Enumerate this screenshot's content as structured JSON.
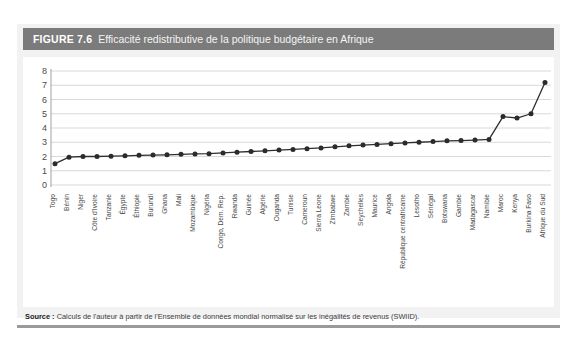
{
  "figure": {
    "number": "FIGURE 7.6",
    "title": "Efficacité redistributive de la politique budgétaire en Afrique",
    "source_label": "Source :",
    "source_text": " Calculs de l'auteur à partir de l'Ensemble de données mondial normalisé sur les inégalités de revenus (SWIID).",
    "header_color": "#7b7b7b",
    "panel_color": "#f2f2f2",
    "rule_color": "#9a9a9a"
  },
  "chart_data": {
    "type": "line",
    "title": "Efficacité redistributive de la politique budgétaire en Afrique",
    "xlabel": "",
    "ylabel": "",
    "ylim": [
      0,
      8
    ],
    "yticks": [
      0,
      1,
      2,
      3,
      4,
      5,
      6,
      7,
      8
    ],
    "grid": true,
    "legend": "none",
    "marker": "circle",
    "line_color": "#2e2e2e",
    "categories": [
      "Togo",
      "Bénin",
      "Niger",
      "Côte d'Ivoire",
      "Tanzanie",
      "Égypte",
      "Éthiopie",
      "Burundi",
      "Ghana",
      "Mali",
      "Mozambique",
      "Nigéria",
      "Congo, Dem. Rep.",
      "Rwanda",
      "Guinée",
      "Algérie",
      "Ouganda",
      "Tunisie",
      "Cameroun",
      "Sierra Leone",
      "Zimbabwe",
      "Zambie",
      "Seychelles",
      "Maurice",
      "Angola",
      "République centrafricaine",
      "Lesotho",
      "Sénégal",
      "Botswana",
      "Gambie",
      "Madagascar",
      "Namibie",
      "Maroc",
      "Kenya",
      "Burkina Faso",
      "Afrique du Sud"
    ],
    "values": [
      1.5,
      1.95,
      2.0,
      2.0,
      2.02,
      2.05,
      2.08,
      2.1,
      2.12,
      2.15,
      2.18,
      2.2,
      2.25,
      2.3,
      2.35,
      2.4,
      2.45,
      2.5,
      2.55,
      2.6,
      2.68,
      2.75,
      2.8,
      2.85,
      2.9,
      2.95,
      3.0,
      3.05,
      3.1,
      3.12,
      3.15,
      3.2,
      4.8,
      4.7,
      5.0,
      7.2
    ]
  }
}
